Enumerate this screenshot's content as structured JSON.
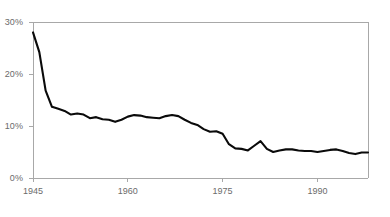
{
  "chart_data": {
    "type": "line",
    "title": "",
    "subtitle": "",
    "xlabel": "",
    "ylabel": "",
    "caption": "",
    "grid": false,
    "legend": null,
    "legend_position": "none",
    "xlim": [
      1945,
      1998
    ],
    "ylim": [
      0,
      30
    ],
    "ytick_values": [
      0,
      10,
      20,
      30
    ],
    "ytick_labels": [
      "0%",
      "10%",
      "20%",
      "30%"
    ],
    "xtick_values": [
      1945,
      1960,
      1975,
      1990
    ],
    "xtick_labels": [
      "1945",
      "1960",
      "1975",
      "1990"
    ],
    "series": [
      {
        "name": "",
        "color": "#0a0a0a",
        "x": [
          1945,
          1946,
          1947,
          1948,
          1949,
          1950,
          1951,
          1952,
          1953,
          1954,
          1955,
          1956,
          1957,
          1958,
          1959,
          1960,
          1961,
          1962,
          1963,
          1964,
          1965,
          1966,
          1967,
          1968,
          1969,
          1970,
          1971,
          1972,
          1973,
          1974,
          1975,
          1976,
          1977,
          1978,
          1979,
          1980,
          1981,
          1982,
          1983,
          1984,
          1985,
          1986,
          1987,
          1988,
          1989,
          1990,
          1991,
          1992,
          1993,
          1994,
          1995,
          1996,
          1997,
          1998
        ],
        "values": [
          28.0,
          24.2,
          16.8,
          13.7,
          13.3,
          12.9,
          12.2,
          12.4,
          12.2,
          11.5,
          11.7,
          11.3,
          11.2,
          10.8,
          11.2,
          11.8,
          12.1,
          12.0,
          11.7,
          11.6,
          11.5,
          11.9,
          12.1,
          11.9,
          11.2,
          10.6,
          10.2,
          9.4,
          8.9,
          9.0,
          8.5,
          6.5,
          5.7,
          5.6,
          5.3,
          6.2,
          7.1,
          5.6,
          5.0,
          5.3,
          5.5,
          5.5,
          5.3,
          5.2,
          5.2,
          5.0,
          5.2,
          5.4,
          5.5,
          5.2,
          4.8,
          4.6,
          4.9,
          4.9
        ]
      }
    ],
    "colors": {
      "line": "#0a0a0a",
      "axis": "#a8a8a8",
      "tick_label": "#6b6b6b",
      "background": "#ffffff"
    }
  },
  "axis": {
    "y_labels": [
      "30%",
      "20%",
      "10%",
      "0%"
    ],
    "x_labels": [
      "1945",
      "1960",
      "1975",
      "1990"
    ]
  },
  "footer": {
    "caption": ""
  }
}
